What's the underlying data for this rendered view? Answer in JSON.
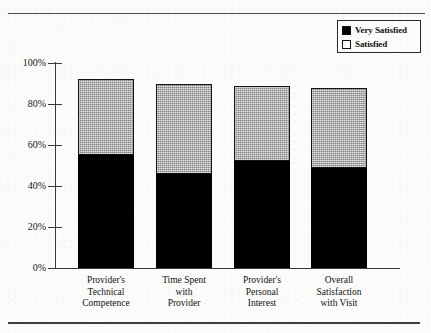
{
  "chart_data": {
    "type": "bar",
    "subtype": "stacked-bar-vertical",
    "title": "",
    "xlabel": "",
    "ylabel": "",
    "ylim": [
      0,
      100
    ],
    "y_tick_labels": [
      "0%",
      "20%",
      "40%",
      "60%",
      "80%",
      "100%"
    ],
    "y_tick_values": [
      0,
      20,
      40,
      60,
      80,
      100
    ],
    "grid": false,
    "legend_position": "top-right",
    "value_unit": "%",
    "categories": [
      "Provider's Technical Competence",
      "Time Spent with Provider",
      "Provider's Personal Interest",
      "Overall Satisfaction with Visit"
    ],
    "category_label_lines": [
      [
        "Provider's",
        "Technical",
        "Competence"
      ],
      [
        "Time Spent",
        "with",
        "Provider"
      ],
      [
        "Provider's",
        "Personal",
        "Interest"
      ],
      [
        "Overall",
        "Satisfaction",
        "with Visit"
      ]
    ],
    "series": [
      {
        "name": "Very Satisfied",
        "color": "#000000",
        "values": [
          55,
          46,
          52,
          49
        ]
      },
      {
        "name": "Satisfied",
        "color": "#a9a9a9",
        "values": [
          37,
          44,
          37,
          39
        ]
      }
    ],
    "totals": [
      92,
      90,
      89,
      88
    ]
  },
  "legend": {
    "items": [
      {
        "label": "Very Satisfied",
        "swatch": "filled-black-square"
      },
      {
        "label": "Satisfied",
        "swatch": "hollow-white-square"
      }
    ]
  },
  "colors": {
    "very_satisfied": "#000000",
    "satisfied": "#a9a9a9",
    "axis": "#3a3a3a",
    "background": "#fbfbfa",
    "text": "#141414"
  }
}
